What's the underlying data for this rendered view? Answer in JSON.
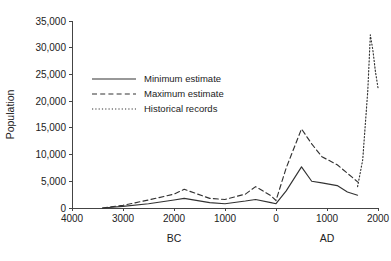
{
  "chart_data": {
    "type": "line",
    "title": "",
    "xlabel": "",
    "ylabel": "Population",
    "xlim": [
      -4000,
      2000
    ],
    "ylim": [
      0,
      35000
    ],
    "grid": false,
    "legend_position": "upper-left-inside",
    "y_ticks": [
      0,
      5000,
      10000,
      15000,
      20000,
      25000,
      30000,
      35000
    ],
    "y_tick_labels": [
      "0",
      "5,000",
      "10,000",
      "15,000",
      "20,000",
      "25,000",
      "30,000",
      "35,000"
    ],
    "x_ticks": [
      -4000,
      -3000,
      -2000,
      -1000,
      0,
      1000,
      2000
    ],
    "x_tick_labels": [
      "4000",
      "3000",
      "2000",
      "1000",
      "0",
      "1000",
      "2000"
    ],
    "era_labels": [
      {
        "text": "BC",
        "x": -2000
      },
      {
        "text": "AD",
        "x": 1000
      }
    ],
    "series": [
      {
        "name": "Minimum estimate",
        "style": "solid",
        "x": [
          -3400,
          -3000,
          -2500,
          -2000,
          -1800,
          -1300,
          -1000,
          -600,
          -400,
          -100,
          0,
          200,
          500,
          700,
          900,
          1200,
          1400,
          1600
        ],
        "values": [
          0,
          300,
          800,
          1500,
          1800,
          1000,
          800,
          1300,
          1600,
          1000,
          800,
          3200,
          7700,
          5000,
          4700,
          4200,
          3000,
          2400
        ]
      },
      {
        "name": "Maximum estimate",
        "style": "dashed",
        "x": [
          -3400,
          -3000,
          -2500,
          -2000,
          -1800,
          -1300,
          -1000,
          -600,
          -400,
          -100,
          0,
          200,
          500,
          700,
          900,
          1200,
          1400,
          1600
        ],
        "values": [
          0,
          500,
          1500,
          2600,
          3500,
          1800,
          1600,
          2600,
          4000,
          2300,
          1400,
          7500,
          14800,
          12000,
          9600,
          8100,
          6500,
          4900
        ]
      },
      {
        "name": "Historical records",
        "style": "dotted",
        "x": [
          1600,
          1700,
          1800,
          1850,
          1900,
          1950,
          2000
        ],
        "values": [
          4000,
          9000,
          22000,
          32400,
          29500,
          25500,
          22500
        ]
      }
    ],
    "legend_entries": [
      {
        "label": "Minimum estimate",
        "style": "solid"
      },
      {
        "label": "Maximum estimate",
        "style": "dashed"
      },
      {
        "label": "Historical records",
        "style": "dotted"
      }
    ],
    "colors": {
      "line": "#333333",
      "axis": "#444444",
      "text": "#222222",
      "background": "#ffffff"
    }
  }
}
